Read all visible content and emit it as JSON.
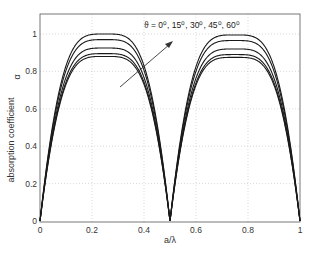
{
  "chart_data": {
    "type": "line",
    "title": "",
    "xlabel": "a/λ",
    "ylabel": "absorption coefficient",
    "ylabel_symbol": "α",
    "xlim": [
      0,
      1
    ],
    "ylim": [
      0,
      1.1
    ],
    "grid": true,
    "x_ticks": [
      "0",
      "0.2",
      "0.4",
      "0.6",
      "0.8",
      "1"
    ],
    "y_ticks": [
      "0",
      "0.2",
      "0.4",
      "0.6",
      "0.8",
      "1"
    ],
    "annotation": {
      "text": "ϑ = 0⁰, 15⁰, 30⁰, 45⁰, 60⁰",
      "arrow": "points from lowest curve toward highest curve, indicating increasing ϑ"
    },
    "x": [
      0,
      0.02,
      0.04,
      0.06,
      0.08,
      0.1,
      0.125,
      0.15,
      0.2,
      0.25,
      0.3,
      0.35,
      0.375,
      0.4,
      0.42,
      0.44,
      0.46,
      0.48,
      0.5,
      0.52,
      0.54,
      0.56,
      0.58,
      0.6,
      0.625,
      0.65,
      0.7,
      0.75,
      0.8,
      0.85,
      0.875,
      0.9,
      0.92,
      0.94,
      0.96,
      0.98,
      1.0
    ],
    "series": [
      {
        "name": "ϑ = 60⁰",
        "peak1": 1.0,
        "peak2": 0.995
      },
      {
        "name": "ϑ = 45⁰",
        "peak1": 0.97,
        "peak2": 0.965
      },
      {
        "name": "ϑ = 30⁰",
        "peak1": 0.925,
        "peak2": 0.92
      },
      {
        "name": "ϑ = 15⁰",
        "peak1": 0.895,
        "peak2": 0.89
      },
      {
        "name": "ϑ = 0⁰",
        "peak1": 0.88,
        "peak2": 0.875
      }
    ],
    "shape_note": "Each curve: alpha = peak * (1 - (1 - |sin(2π·a/λ)|)^2); zeros at a/λ = 0, 0.5, 1; maxima at 0.25 and 0.75"
  },
  "labels": {
    "xlabel": "a/λ",
    "ylabel": "absorption coefficient",
    "ysymbol": "α",
    "annotation": "ϑ = 0⁰, 15⁰, 30⁰, 45⁰, 60⁰"
  },
  "colors": {
    "line": "#1a1a1a",
    "grid": "#bfbfbf",
    "axis": "#555555"
  }
}
